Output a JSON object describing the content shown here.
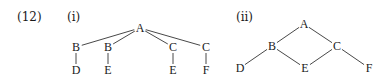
{
  "example_number": "(12)",
  "panels": [
    {
      "label": "(i)",
      "nodes": [
        {
          "id": "A",
          "text": "A",
          "x": 140,
          "y": 28
        },
        {
          "id": "B1",
          "text": "B",
          "x": 76,
          "y": 47
        },
        {
          "id": "B2",
          "text": "B",
          "x": 108,
          "y": 47
        },
        {
          "id": "C1",
          "text": "C",
          "x": 173,
          "y": 47
        },
        {
          "id": "C2",
          "text": "C",
          "x": 206,
          "y": 47
        },
        {
          "id": "D",
          "text": "D",
          "x": 76,
          "y": 70
        },
        {
          "id": "E1",
          "text": "E",
          "x": 108,
          "y": 70
        },
        {
          "id": "E2",
          "text": "E",
          "x": 173,
          "y": 70
        },
        {
          "id": "F",
          "text": "F",
          "x": 206,
          "y": 70
        }
      ],
      "edges": [
        [
          "A",
          "B1"
        ],
        [
          "A",
          "B2"
        ],
        [
          "A",
          "C1"
        ],
        [
          "A",
          "C2"
        ],
        [
          "B1",
          "D"
        ],
        [
          "B2",
          "E1"
        ],
        [
          "C1",
          "E2"
        ],
        [
          "C2",
          "F"
        ]
      ]
    },
    {
      "label": "(ii)",
      "nodes": [
        {
          "id": "A",
          "text": "A",
          "x": 304,
          "y": 24
        },
        {
          "id": "B",
          "text": "B",
          "x": 272,
          "y": 46
        },
        {
          "id": "C",
          "text": "C",
          "x": 337,
          "y": 46
        },
        {
          "id": "D",
          "text": "D",
          "x": 240,
          "y": 68
        },
        {
          "id": "E",
          "text": "E",
          "x": 305,
          "y": 68
        },
        {
          "id": "F",
          "text": "F",
          "x": 369,
          "y": 68
        }
      ],
      "edges": [
        [
          "A",
          "B"
        ],
        [
          "A",
          "C"
        ],
        [
          "B",
          "D"
        ],
        [
          "B",
          "E"
        ],
        [
          "C",
          "E"
        ],
        [
          "C",
          "F"
        ]
      ]
    }
  ]
}
